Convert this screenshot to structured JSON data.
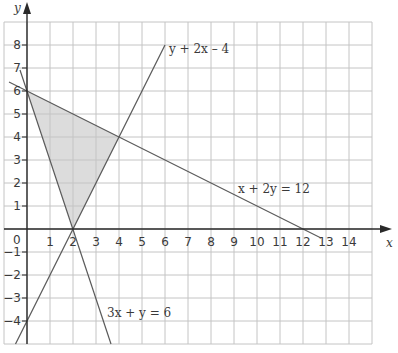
{
  "chart_data": {
    "type": "line",
    "title": "",
    "xlabel": "x",
    "ylabel": "y",
    "xlim": [
      -1,
      15
    ],
    "ylim": [
      -5,
      9
    ],
    "grid": true,
    "x_ticks": [
      "0",
      "1",
      "2",
      "3",
      "4",
      "5",
      "6",
      "7",
      "8",
      "9",
      "10",
      "11",
      "12",
      "13",
      "14"
    ],
    "y_ticks": [
      "8",
      "7",
      "6",
      "5",
      "4",
      "3",
      "2",
      "1",
      "−1",
      "−2",
      "−3",
      "−4"
    ],
    "series": [
      {
        "name": "y + 2x – 4",
        "equation": "y = 2x − 4",
        "points": [
          [
            -0.5,
            -5
          ],
          [
            6,
            8
          ]
        ]
      },
      {
        "name": "3x + y = 6",
        "equation": "3x + y = 6",
        "points": [
          [
            -0.3,
            6.9
          ],
          [
            3.67,
            -5
          ]
        ]
      },
      {
        "name": "x + 2y = 12",
        "equation": "x + 2y = 12",
        "points": [
          [
            -0.8,
            6.4
          ],
          [
            12.8,
            -0.4
          ]
        ]
      }
    ],
    "shaded_region": {
      "vertices": [
        [
          0,
          6
        ],
        [
          4,
          4
        ],
        [
          2,
          0
        ]
      ],
      "color": "#dcdcdc"
    },
    "annotations": [
      {
        "text": "y + 2x – 4",
        "x": 6.2,
        "y": 7.6
      },
      {
        "text": "x + 2y = 12",
        "x": 9.2,
        "y": 1.6
      },
      {
        "text": "3x + y = 6",
        "x": 3.5,
        "y": -3.8
      }
    ]
  },
  "labels": {
    "origin": "0",
    "x_axis": "x",
    "y_axis": "y",
    "eq1": "y + 2x – 4",
    "eq2": "x + 2y = 12",
    "eq3": "3x + y = 6"
  },
  "colors": {
    "grid": "#c4c4c4",
    "axis": "#2a2a2a",
    "line": "#5a5a5a",
    "shade": "#dcdcdc"
  }
}
